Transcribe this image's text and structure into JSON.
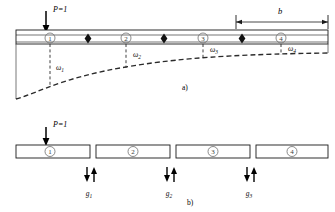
{
  "figure": {
    "type": "structural-beam-diagram",
    "panels": [
      {
        "id": "a",
        "caption": "a)",
        "description": "Continuous beam with unit load and deflection curve",
        "load_label": "P=1",
        "dimension_label": "b",
        "nodes": [
          "1",
          "2",
          "3",
          "4"
        ],
        "ordinate_labels": [
          "ω",
          "ω",
          "ω",
          "ω"
        ],
        "ordinate_subscripts": [
          "1",
          "2",
          "3",
          "4"
        ],
        "hinge_count": 3
      },
      {
        "id": "b",
        "caption": "b)",
        "description": "Separated beam segments with interface force pairs",
        "load_label": "P=1",
        "segments": [
          "1",
          "2",
          "3",
          "4"
        ],
        "force_labels": [
          "g",
          "g",
          "g"
        ],
        "force_subscripts": [
          "1",
          "2",
          "3"
        ]
      }
    ]
  },
  "colors": {
    "stroke": "#1a1a1a",
    "beam_fill": "#ffffff",
    "dashed": "#2b2b2b",
    "node_circle": "#6d6d6d"
  }
}
